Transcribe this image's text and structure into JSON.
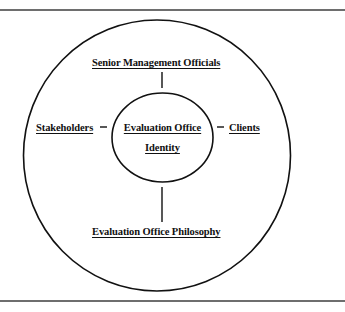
{
  "diagram": {
    "type": "concentric-relationship",
    "center": {
      "line1": "Evaluation Office",
      "line2": "Identity"
    },
    "nodes": {
      "top": "Senior Management Officials",
      "left": "Stakeholders",
      "right": "Clients",
      "bottom": "Evaluation Office Philosophy"
    },
    "colors": {
      "stroke": "#111111",
      "rule": "#6e6e6e",
      "background": "#ffffff"
    }
  }
}
